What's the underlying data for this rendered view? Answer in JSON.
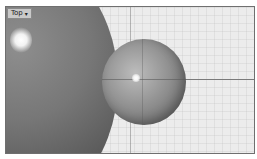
{
  "viewport": {
    "label": "Top",
    "label_menu_icon": "▾",
    "background_color": "#ececec",
    "border_color": "#6f6f6f"
  },
  "scene": {
    "objects": [
      {
        "name": "large-sphere",
        "shade": "dark-gray"
      },
      {
        "name": "small-sphere",
        "shade": "medium-gray"
      }
    ],
    "axis_line": "horizontal x-axis"
  }
}
